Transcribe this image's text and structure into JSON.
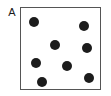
{
  "figure": {
    "panel_label": "A",
    "width": 111,
    "height": 96,
    "background_color": "#ffffff"
  },
  "plot_box": {
    "x": 20,
    "y": 7,
    "width": 81,
    "height": 83,
    "border_color": "#555555",
    "border_width": 1,
    "fill_color": "#ffffff"
  },
  "chart_data": {
    "type": "scatter",
    "title": "A",
    "xlabel": "",
    "ylabel": "",
    "grid": false,
    "legend": "none",
    "point_color": "#1c1c1c",
    "point_radius": 5,
    "point_count": 8,
    "xlim": [
      0,
      81
    ],
    "ylim": [
      0,
      83
    ],
    "axis_ticks": [],
    "series": [
      {
        "name": "points",
        "color": "#1c1c1c",
        "points": [
          {
            "id": "p1",
            "x": 13,
            "y": 14,
            "r": 5
          },
          {
            "id": "p2",
            "x": 63,
            "y": 18,
            "r": 5
          },
          {
            "id": "p3",
            "x": 34,
            "y": 37,
            "r": 5
          },
          {
            "id": "p4",
            "x": 66,
            "y": 40,
            "r": 5
          },
          {
            "id": "p5",
            "x": 15,
            "y": 55,
            "r": 5
          },
          {
            "id": "p6",
            "x": 46,
            "y": 58,
            "r": 5
          },
          {
            "id": "p7",
            "x": 68,
            "y": 70,
            "r": 5
          },
          {
            "id": "p8",
            "x": 21,
            "y": 74,
            "r": 5
          }
        ]
      }
    ]
  }
}
